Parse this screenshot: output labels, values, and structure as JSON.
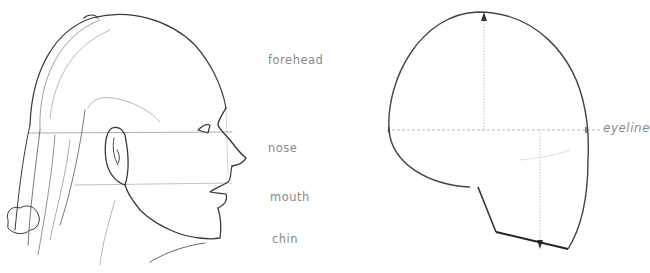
{
  "figure": {
    "left_panel": {
      "description": "Pencil sketch of a girl's head in profile with ponytail",
      "labels": [
        {
          "id": "forehead",
          "text": "forehead"
        },
        {
          "id": "nose",
          "text": "nose"
        },
        {
          "id": "mouth",
          "text": "mouth"
        },
        {
          "id": "chin",
          "text": "chin"
        }
      ]
    },
    "right_panel": {
      "description": "Simplified head shape diagram with eyeline and measurement arrows",
      "labels": [
        {
          "id": "eyeline",
          "text": "eyeline"
        }
      ]
    },
    "colors": {
      "background": "#ffffff",
      "line": "#3a3a3a",
      "guide": "#9a9a9a",
      "label": "#8a8a8a"
    }
  }
}
